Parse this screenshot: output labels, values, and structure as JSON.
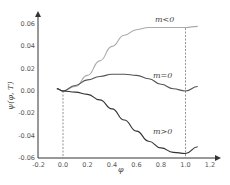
{
  "chart_data": {
    "type": "line",
    "title": "",
    "xlabel": "φ",
    "ylabel": "ψ(φ, T)",
    "xlim": [
      -0.2,
      1.25
    ],
    "ylim": [
      -0.06,
      0.065
    ],
    "xticks": [
      "-0.2",
      "0.0",
      "0.2",
      "0.4",
      "0.6",
      "0.8",
      "1.0",
      "1.2"
    ],
    "yticks": [
      "0.06",
      "0.04",
      "0.02",
      "0.00",
      "-0.02",
      "-0.04",
      "-0.06"
    ],
    "grid": false,
    "legend": "inline annotations",
    "annotations": [
      "m<0",
      "m=0",
      "m>0"
    ],
    "reference_lines": [
      {
        "x": 0.0,
        "style": "dashed"
      },
      {
        "x": 1.0,
        "style": "dashed"
      }
    ],
    "x": [
      -0.05,
      0.0,
      0.1,
      0.2,
      0.3,
      0.4,
      0.5,
      0.6,
      0.7,
      0.8,
      0.9,
      1.0,
      1.1
    ],
    "series": [
      {
        "name": "m<0",
        "color": "#aaaaaa",
        "values": [
          0.002,
          0.0,
          0.004,
          0.014,
          0.027,
          0.04,
          0.05,
          0.055,
          0.057,
          0.057,
          0.057,
          0.057,
          0.058
        ]
      },
      {
        "name": "m=0",
        "color": "#555555",
        "values": [
          0.002,
          0.0,
          0.005,
          0.01,
          0.013,
          0.015,
          0.015,
          0.014,
          0.011,
          0.006,
          0.002,
          0.0,
          0.004
        ]
      },
      {
        "name": "m>0",
        "color": "#333333",
        "values": [
          0.002,
          0.0,
          -0.001,
          -0.003,
          -0.008,
          -0.016,
          -0.026,
          -0.036,
          -0.045,
          -0.051,
          -0.055,
          -0.056,
          -0.05
        ]
      }
    ]
  }
}
